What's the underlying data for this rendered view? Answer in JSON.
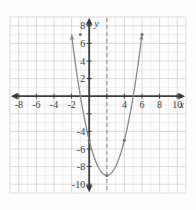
{
  "chart_data": {
    "type": "line",
    "title": "",
    "xlabel": "x",
    "ylabel": "y",
    "grid": true,
    "legend": "none",
    "xlim": [
      -9,
      11
    ],
    "ylim": [
      -11,
      9
    ],
    "x_ticks": [
      -8,
      -6,
      -4,
      -2,
      4,
      6,
      8,
      10
    ],
    "y_ticks": [
      8,
      6,
      4,
      2,
      -4,
      -6,
      -8,
      -10
    ],
    "x_tick_labels": [
      "-8",
      "-6",
      "-4",
      "-2",
      "4",
      "6",
      "8",
      "10"
    ],
    "y_tick_labels": [
      "8",
      "6",
      "4",
      "2",
      "-4",
      "-6",
      "-8",
      "-10"
    ],
    "grid_step": 1,
    "tick_step": 2,
    "series": [
      {
        "name": "parabola",
        "kind": "parabola",
        "vertex": [
          2,
          -9
        ],
        "a": 1,
        "equation": "y = (x - 2)^2 - 9",
        "color": "#8a8a8a",
        "marked_points": [
          [
            -1,
            7
          ],
          [
            0,
            -5
          ],
          [
            2,
            -9
          ],
          [
            4,
            -5
          ],
          [
            6,
            7
          ]
        ],
        "x_range": [
          -2.0,
          6.0
        ],
        "arrows": [
          "start",
          "end"
        ]
      },
      {
        "name": "axis-of-symmetry",
        "kind": "vertical-dashed-line",
        "x": 2,
        "color": "#8a8a8a",
        "dashed": true
      }
    ],
    "axis_color": "#3b3b3b",
    "grid_color": "#dedede",
    "border_color": "#e2e2e2",
    "background": "#fefefe"
  },
  "labels": {
    "x_axis_name": "x",
    "y_axis_name": "y"
  }
}
